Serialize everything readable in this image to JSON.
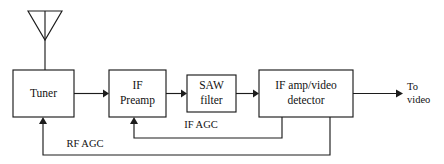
{
  "diagram": {
    "background_color": "#ffffff",
    "line_color": "#1c1c1c",
    "text_color": "#111111",
    "blocks": [
      {
        "id": "tuner",
        "label": "Tuner",
        "line1": "Tuner",
        "line2": ""
      },
      {
        "id": "preamp",
        "label": "IF Preamp",
        "line1": "IF",
        "line2": "Preamp"
      },
      {
        "id": "saw",
        "label": "SAW filter",
        "line1": "SAW",
        "line2": "filter"
      },
      {
        "id": "ifamp",
        "label": "IF amp/video detector",
        "line1": "IF amp/video",
        "line2": "detector"
      }
    ],
    "signals": [
      {
        "id": "if-agc",
        "label": "IF AGC"
      },
      {
        "id": "rf-agc",
        "label": "RF AGC"
      }
    ],
    "output": {
      "line1": "To",
      "line2": "video"
    },
    "antenna": {
      "name": "antenna-symbol"
    }
  }
}
